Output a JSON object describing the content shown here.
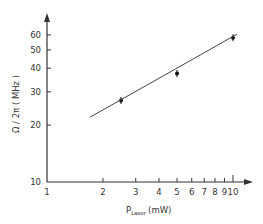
{
  "chart_data": {
    "type": "scatter",
    "title": "",
    "xlabel": "P_Laser (mW)",
    "xlabel_main": "P",
    "xlabel_sub": "Laser",
    "xlabel_unit": "(mW)",
    "ylabel": "Ω / 2π ( MHz )",
    "xscale": "log",
    "yscale": "log",
    "xlim": [
      1,
      10.5
    ],
    "ylim": [
      10,
      70
    ],
    "grid": false,
    "legend": null,
    "x_ticks": [
      1,
      2,
      3,
      4,
      5,
      6,
      7,
      8,
      9,
      10
    ],
    "x_tick_labels": [
      "1",
      "2",
      "3",
      "4",
      "5",
      "6",
      "7",
      "8",
      "9",
      "10"
    ],
    "y_ticks": [
      10,
      20,
      30,
      40,
      50,
      60
    ],
    "y_tick_labels": [
      "10",
      "20",
      "30",
      "40",
      "50",
      "60"
    ],
    "series": [
      {
        "name": "measured",
        "kind": "points",
        "x": [
          2.5,
          5,
          10
        ],
        "y": [
          27,
          37.5,
          58
        ]
      },
      {
        "name": "fit",
        "kind": "line",
        "x": [
          1.7,
          10.5
        ],
        "y": [
          22,
          60.5
        ]
      }
    ]
  },
  "colors": {
    "axis": "#333333",
    "line": "#444444",
    "marker": "#111111",
    "background": "#ffffff"
  }
}
